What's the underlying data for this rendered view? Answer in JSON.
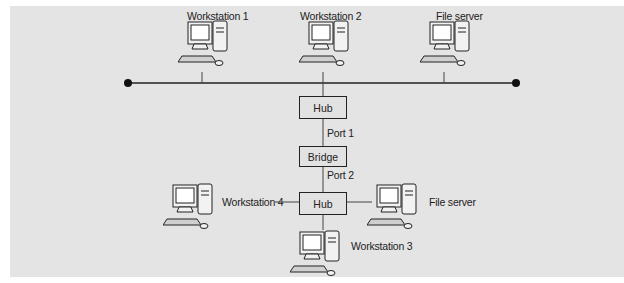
{
  "diagram": {
    "top_segment": {
      "nodes": [
        {
          "label": "Workstation 1",
          "type": "workstation"
        },
        {
          "label": "Workstation 2",
          "type": "workstation"
        },
        {
          "label": "File server",
          "type": "server"
        }
      ],
      "bus": "shared-bus-line"
    },
    "devices": {
      "hub_top": "Hub",
      "bridge": "Bridge",
      "hub_bottom": "Hub"
    },
    "ports": {
      "port1": "Port 1",
      "port2": "Port 2"
    },
    "bottom_segment": {
      "nodes": [
        {
          "label": "Workstation 4",
          "type": "workstation"
        },
        {
          "label": "File server",
          "type": "server"
        },
        {
          "label": "Workstation 3",
          "type": "workstation"
        }
      ]
    },
    "colors": {
      "background": "#e4e4e4",
      "line": "#222222"
    }
  }
}
